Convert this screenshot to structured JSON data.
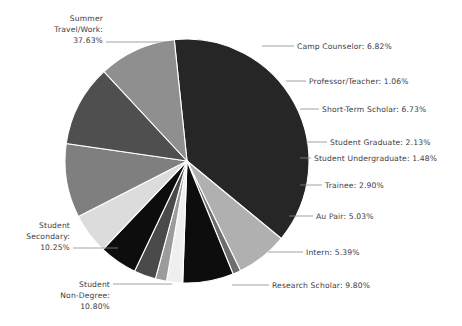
{
  "chart_data": {
    "type": "pie",
    "title": "",
    "subtitle": "",
    "xlabel": "",
    "ylabel": "",
    "legend_position": "none",
    "grid": false,
    "value_suffix": "%",
    "categories": [
      "Summer Travel/Work",
      "Camp Counselor",
      "Professor/Teacher",
      "Short-Term Scholar",
      "Student Graduate",
      "Student Undergraduate",
      "Trainee",
      "Au Pair",
      "Intern",
      "Research Scholar",
      "Student Non-Degree",
      "Student Secondary"
    ],
    "values": [
      37.63,
      6.82,
      1.06,
      6.73,
      2.13,
      1.48,
      2.9,
      5.03,
      5.39,
      9.8,
      10.8,
      10.25
    ],
    "colors": [
      "#262626",
      "#b0b0b0",
      "#6e6e6e",
      "#0d0d0d",
      "#efefef",
      "#9c9c9c",
      "#4a4a4a",
      "#0d0d0d",
      "#dcdcdc",
      "#7f7f7f",
      "#4f4f4f",
      "#8f8f8f"
    ],
    "slices": [
      {
        "label": "Summer Travel/Work",
        "value": 37.63,
        "value_text": "37.63%",
        "color": "#262626",
        "label_lines": [
          "Summer",
          "Travel/Work:",
          "37.63%"
        ],
        "label_side": "left",
        "label_x": 103,
        "label_y": 21,
        "leader": [
          [
            106,
            42
          ],
          [
            174,
            42
          ]
        ]
      },
      {
        "label": "Camp Counselor",
        "value": 6.82,
        "value_text": "6.82%",
        "color": "#b0b0b0",
        "label_lines": [
          "Camp Counselor: 6.82%"
        ],
        "label_side": "right",
        "label_x": 297,
        "label_y": 49,
        "leader": [
          [
            262,
            46
          ],
          [
            294,
            46
          ]
        ]
      },
      {
        "label": "Professor/Teacher",
        "value": 1.06,
        "value_text": "1.06%",
        "color": "#6e6e6e",
        "label_lines": [
          "Professor/Teacher: 1.06%"
        ],
        "label_side": "right",
        "label_x": 309,
        "label_y": 84,
        "leader": [
          [
            286,
            81
          ],
          [
            306,
            81
          ]
        ]
      },
      {
        "label": "Short-Term Scholar",
        "value": 6.73,
        "value_text": "6.73%",
        "color": "#0d0d0d",
        "label_lines": [
          "Short-Term Scholar: 6.73%"
        ],
        "label_side": "right",
        "label_x": 322,
        "label_y": 112,
        "leader": [
          [
            300,
            109
          ],
          [
            319,
            109
          ]
        ]
      },
      {
        "label": "Student Graduate",
        "value": 2.13,
        "value_text": "2.13%",
        "color": "#efefef",
        "label_lines": [
          "Student Graduate: 2.13%"
        ],
        "label_side": "right",
        "label_x": 330,
        "label_y": 145,
        "leader": [
          [
            306,
            142
          ],
          [
            327,
            142
          ]
        ]
      },
      {
        "label": "Student Undergraduate",
        "value": 1.48,
        "value_text": "1.48%",
        "color": "#9c9c9c",
        "label_lines": [
          "Student Undergraduate: 1.48%"
        ],
        "label_side": "right",
        "label_x": 314,
        "label_y": 161,
        "leader": [
          [
            300,
            158
          ],
          [
            311,
            158
          ]
        ]
      },
      {
        "label": "Trainee",
        "value": 2.9,
        "value_text": "2.90%",
        "color": "#4a4a4a",
        "label_lines": [
          "Trainee: 2.90%"
        ],
        "label_side": "right",
        "label_x": 325,
        "label_y": 188,
        "leader": [
          [
            300,
            185
          ],
          [
            322,
            185
          ]
        ]
      },
      {
        "label": "Au Pair",
        "value": 5.03,
        "value_text": "5.03%",
        "color": "#0d0d0d",
        "label_lines": [
          "Au Pair: 5.03%"
        ],
        "label_side": "right",
        "label_x": 316,
        "label_y": 219,
        "leader": [
          [
            289,
            216
          ],
          [
            313,
            216
          ]
        ]
      },
      {
        "label": "Intern",
        "value": 5.39,
        "value_text": "5.39%",
        "color": "#dcdcdc",
        "label_lines": [
          "Intern: 5.39%"
        ],
        "label_side": "right",
        "label_x": 306,
        "label_y": 255,
        "leader": [
          [
            268,
            252
          ],
          [
            303,
            252
          ]
        ]
      },
      {
        "label": "Research Scholar",
        "value": 9.8,
        "value_text": "9.80%",
        "color": "#7f7f7f",
        "label_lines": [
          "Research Scholar: 9.80%"
        ],
        "label_side": "right",
        "label_x": 272,
        "label_y": 288,
        "leader": [
          [
            232,
            285
          ],
          [
            269,
            285
          ]
        ]
      },
      {
        "label": "Student Non-Degree",
        "value": 10.8,
        "value_text": "10.80%",
        "color": "#4f4f4f",
        "label_lines": [
          "Student",
          "Non-Degree:",
          "10.80%"
        ],
        "label_side": "left",
        "label_x": 110,
        "label_y": 287,
        "leader": [
          [
            113,
            284
          ],
          [
            172,
            284
          ]
        ]
      },
      {
        "label": "Student Secondary",
        "value": 10.25,
        "value_text": "10.25%",
        "color": "#8f8f8f",
        "label_lines": [
          "Student",
          "Secondary:",
          "10.25%"
        ],
        "label_side": "left",
        "label_x": 70,
        "label_y": 228,
        "leader": [
          [
            73,
            248
          ],
          [
            118,
            248
          ]
        ]
      }
    ],
    "geometry": {
      "center_x": 187,
      "center_y": 161,
      "radius": 122,
      "start_angle_deg": -96
    }
  }
}
